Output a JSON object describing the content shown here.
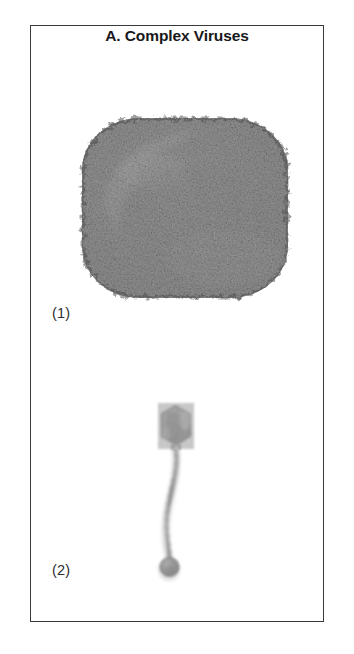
{
  "figure": {
    "title": "A. Complex Viruses",
    "frame": {
      "border_color": "#3a3a3a",
      "background": "#ffffff"
    },
    "panels": [
      {
        "label": "(1)",
        "subject": "poxvirus",
        "description": "brick-shaped complex virus particle electron micrograph",
        "icon": "poxvirus-particle-icon",
        "tone_dark": "#5a5a5a",
        "tone_mid": "#8a8a8a",
        "tone_light": "#d8d8d8"
      },
      {
        "label": "(2)",
        "subject": "bacteriophage",
        "description": "tailed bacteriophage with hexagonal head, long curved tail and base plate",
        "icon": "bacteriophage-particle-icon",
        "tone_dark": "#8d8d8d",
        "tone_mid": "#b0b0b0",
        "tone_light": "#dedede"
      }
    ],
    "colors": {
      "text": "#18181a",
      "label_text": "#2d2d30",
      "page_background": "#ffffff"
    }
  }
}
